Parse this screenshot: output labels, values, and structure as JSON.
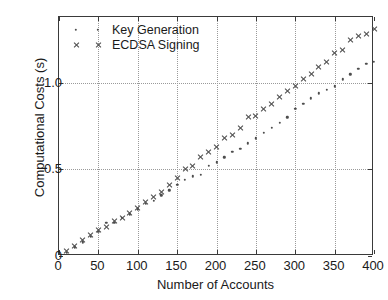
{
  "chart_data": {
    "type": "scatter",
    "title": "",
    "xlabel": "Number of Accounts",
    "ylabel": "Computational Costs (s)",
    "xlim": [
      0,
      400
    ],
    "ylim": [
      0,
      1.38
    ],
    "grid": true,
    "legend_position": "upper-left-inside",
    "xticks": [
      0,
      50,
      100,
      150,
      200,
      250,
      300,
      350,
      400
    ],
    "xtick_labels": [
      "0",
      "50",
      "100",
      "150",
      "200",
      "250",
      "300",
      "350",
      "400"
    ],
    "yticks": [
      0,
      0.5,
      1.0
    ],
    "ytick_labels": [
      "0",
      "0.5",
      "1.0"
    ],
    "x": [
      10,
      20,
      30,
      40,
      50,
      60,
      70,
      80,
      90,
      100,
      110,
      120,
      130,
      140,
      150,
      160,
      170,
      180,
      190,
      200,
      210,
      220,
      230,
      240,
      250,
      260,
      270,
      280,
      290,
      300,
      310,
      320,
      330,
      340,
      350,
      360,
      370,
      380,
      390,
      400
    ],
    "series": [
      {
        "name": "Key Generation",
        "marker": "dot",
        "color": "#4d4d4d",
        "values": [
          0.02,
          0.05,
          0.08,
          0.11,
          0.14,
          0.19,
          0.19,
          0.22,
          0.24,
          0.27,
          0.3,
          0.32,
          0.35,
          0.38,
          0.41,
          0.44,
          0.46,
          0.47,
          0.52,
          0.54,
          0.57,
          0.6,
          0.62,
          0.65,
          0.68,
          0.71,
          0.74,
          0.77,
          0.8,
          0.85,
          0.88,
          0.91,
          0.94,
          0.96,
          0.98,
          1.02,
          1.05,
          1.08,
          1.11,
          1.12
        ]
      },
      {
        "name": "ECDSA Signing",
        "marker": "x",
        "color": "#4d4d4d",
        "values": [
          0.03,
          0.06,
          0.09,
          0.12,
          0.15,
          0.17,
          0.2,
          0.22,
          0.25,
          0.28,
          0.31,
          0.34,
          0.37,
          0.41,
          0.45,
          0.5,
          0.52,
          0.57,
          0.6,
          0.63,
          0.68,
          0.7,
          0.74,
          0.8,
          0.81,
          0.85,
          0.88,
          0.92,
          0.95,
          0.98,
          1.02,
          1.05,
          1.09,
          1.12,
          1.17,
          1.19,
          1.25,
          1.27,
          1.28,
          1.31
        ]
      }
    ]
  }
}
